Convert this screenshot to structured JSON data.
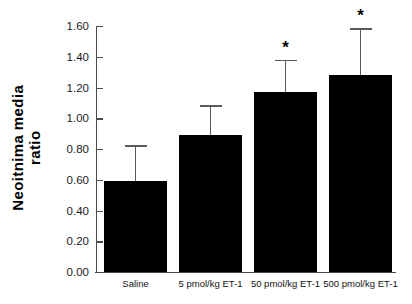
{
  "chart_data": {
    "type": "bar",
    "title": "",
    "subtitle": "",
    "xlabel": "",
    "ylabel": "Neoitnima media ratio",
    "ylabel_line1": "Neoitnima media",
    "ylabel_line2": "ratio",
    "categories": [
      "Saline",
      "5 pmol/kg ET-1",
      "50 pmol/kg ET-1",
      "500 pmol/kg ET-1"
    ],
    "values": [
      0.59,
      0.89,
      1.17,
      1.28
    ],
    "errors_upper": [
      0.825,
      1.085,
      1.38,
      1.585
    ],
    "error_magnitudes": [
      0.235,
      0.195,
      0.21,
      0.305
    ],
    "annotations": [
      "",
      "",
      "*",
      "*"
    ],
    "significance_marker": "*",
    "ylim": [
      0.0,
      1.6
    ],
    "ytick_values": [
      0.0,
      0.2,
      0.4,
      0.6,
      0.8,
      1.0,
      1.2,
      1.4,
      1.6
    ],
    "ytick_labels": [
      "0.00",
      "0.20",
      "0.40",
      "0.60",
      "0.80",
      "1.00",
      "1.20",
      "1.40",
      "1.60"
    ],
    "grid": false,
    "legend": false,
    "legend_position": "none",
    "bar_color": "#000000",
    "error_color": "#5a5a5a",
    "axis_color": "#4a4a4a",
    "background_color": "#ffffff"
  }
}
